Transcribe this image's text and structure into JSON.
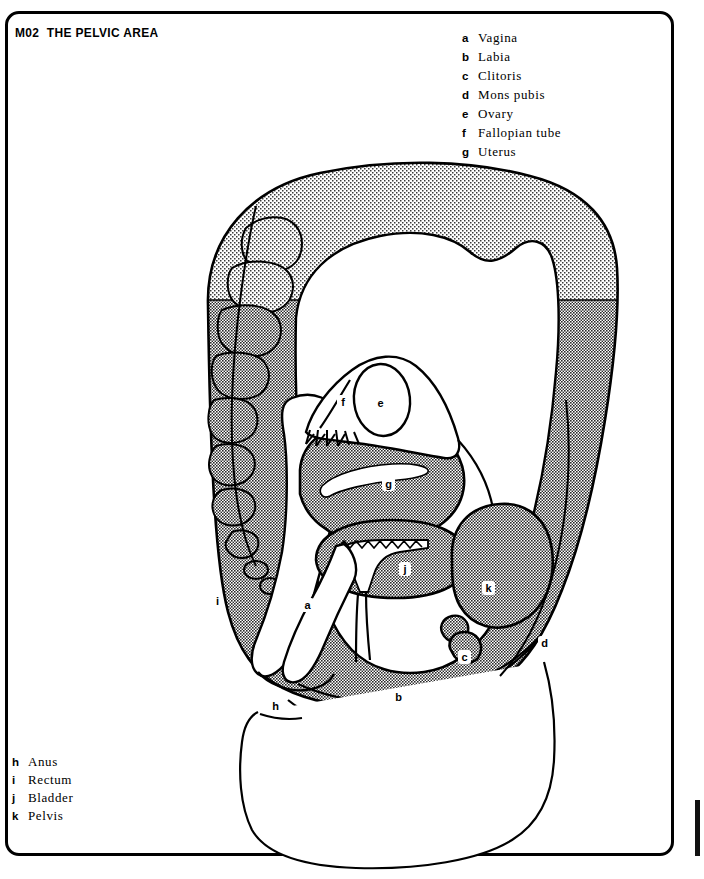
{
  "page": {
    "title": "M02  THE PELVIC AREA",
    "code": "M02",
    "heading": "THE PELVIC AREA",
    "border_color": "#000000",
    "background_color": "#ffffff"
  },
  "legend_top": {
    "items": [
      {
        "key": "a",
        "label": "Vagina"
      },
      {
        "key": "b",
        "label": "Labia"
      },
      {
        "key": "c",
        "label": "Clitoris"
      },
      {
        "key": "d",
        "label": "Mons pubis"
      },
      {
        "key": "e",
        "label": "Ovary"
      },
      {
        "key": "f",
        "label": "Fallopian tube"
      },
      {
        "key": "g",
        "label": "Uterus"
      }
    ]
  },
  "legend_bottom": {
    "items": [
      {
        "key": "h",
        "label": "Anus"
      },
      {
        "key": "i",
        "label": "Rectum"
      },
      {
        "key": "j",
        "label": "Bladder"
      },
      {
        "key": "k",
        "label": "Pelvis"
      }
    ]
  },
  "figure": {
    "tones": {
      "mid_gray": "#9a9a9a",
      "light_gray": "#d8d8d8",
      "outline": "#000000",
      "white": "#ffffff"
    },
    "callouts": [
      {
        "key": "a",
        "organ": "Vagina",
        "x": 307,
        "y": 605
      },
      {
        "key": "b",
        "organ": "Labia",
        "x": 398,
        "y": 697
      },
      {
        "key": "c",
        "organ": "Clitoris",
        "x": 464,
        "y": 657
      },
      {
        "key": "d",
        "organ": "Mons pubis",
        "x": 544,
        "y": 643
      },
      {
        "key": "e",
        "organ": "Ovary",
        "x": 380,
        "y": 403
      },
      {
        "key": "f",
        "organ": "Fallopian tube",
        "x": 343,
        "y": 402
      },
      {
        "key": "g",
        "organ": "Uterus",
        "x": 388,
        "y": 484
      },
      {
        "key": "h",
        "organ": "Anus",
        "x": 275,
        "y": 706
      },
      {
        "key": "i",
        "organ": "Rectum",
        "x": 217,
        "y": 601
      },
      {
        "key": "j",
        "organ": "Bladder",
        "x": 405,
        "y": 569
      },
      {
        "key": "k",
        "organ": "Pelvis",
        "x": 488,
        "y": 588
      }
    ]
  }
}
